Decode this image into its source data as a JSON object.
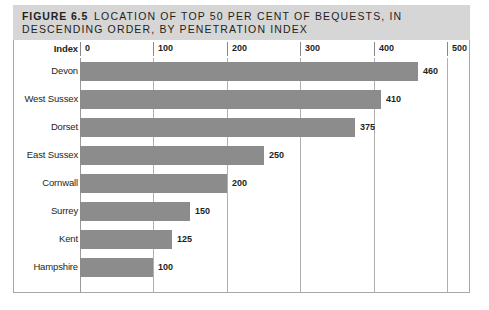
{
  "figure": {
    "label": "FIGURE 6.5",
    "title_line1": "LOCATION OF TOP 50 PER CENT OF BEQUESTS, IN",
    "title_line2": "DESCENDING ORDER, BY PENETRATION INDEX",
    "index_label": "Index"
  },
  "colors": {
    "band_background": "#d6d6d6",
    "bar_fill": "#8c8c8c",
    "gridline": "#b0b0b0",
    "text": "#231f20",
    "frame_border": "#a8a8a8"
  },
  "chart_data": {
    "type": "bar",
    "orientation": "horizontal",
    "title": "FIGURE 6.5 LOCATION OF TOP 50 PER CENT OF BEQUESTS, IN DESCENDING ORDER, BY PENETRATION INDEX",
    "xlabel": "Index",
    "ylabel": "",
    "xlim": [
      0,
      500
    ],
    "xticks": [
      0,
      100,
      200,
      300,
      400,
      500
    ],
    "xtick_labels": [
      "0",
      "100",
      "200",
      "300",
      "400",
      "500"
    ],
    "grid": true,
    "legend": false,
    "categories": [
      "Devon",
      "West Sussex",
      "Dorset",
      "East Sussex",
      "Cornwall",
      "Surrey",
      "Kent",
      "Hampshire"
    ],
    "values": [
      460,
      410,
      375,
      250,
      200,
      150,
      125,
      100
    ],
    "value_labels": [
      "460",
      "410",
      "375",
      "250",
      "200",
      "150",
      "125",
      "100"
    ]
  }
}
